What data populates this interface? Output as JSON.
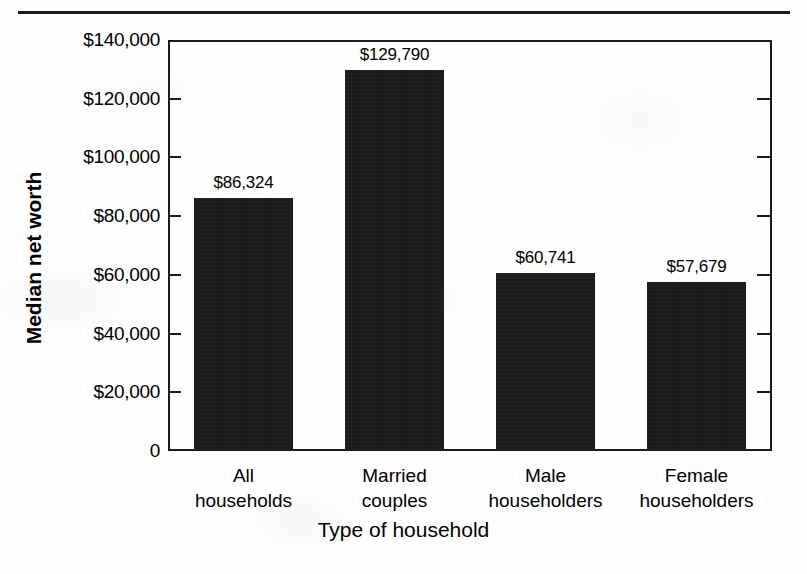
{
  "chart_data": {
    "type": "bar",
    "title": "",
    "xlabel": "Type of household",
    "ylabel": "Median net worth",
    "categories": [
      "All households",
      "Married couples",
      "Male householders",
      "Female householders"
    ],
    "category_lines": [
      [
        "All",
        "households"
      ],
      [
        "Married",
        "couples"
      ],
      [
        "Male",
        "householders"
      ],
      [
        "Female",
        "householders"
      ]
    ],
    "values": [
      86324,
      129790,
      60741,
      57679
    ],
    "value_labels": [
      "$86,324",
      "$129,790",
      "$60,741",
      "$57,679"
    ],
    "ylim": [
      0,
      140000
    ],
    "ytick_values": [
      0,
      20000,
      40000,
      60000,
      80000,
      100000,
      120000,
      140000
    ],
    "ytick_labels": [
      "0",
      "$20,000",
      "$40,000",
      "$60,000",
      "$80,000",
      "$100,000",
      "$120,000",
      "$140,000"
    ],
    "grid": false,
    "legend": null,
    "bar_color": "#151515",
    "axis_color": "#1a1a1a",
    "background_color": "#fefefe"
  }
}
